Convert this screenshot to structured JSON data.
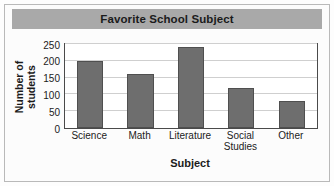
{
  "chart_data": {
    "type": "bar",
    "title": "Favorite School Subject",
    "xlabel": "Subject",
    "ylabel_line1": "Number of",
    "ylabel_line2": "students",
    "categories": [
      "Science",
      "Math",
      "Literature",
      "Social Studies",
      "Other"
    ],
    "category_lines": [
      [
        "Science"
      ],
      [
        "Math"
      ],
      [
        "Literature"
      ],
      [
        "Social",
        "Studies"
      ],
      [
        "Other"
      ]
    ],
    "values": [
      200,
      160,
      240,
      120,
      80
    ],
    "ylim": [
      0,
      250
    ],
    "yticks": [
      0,
      50,
      100,
      150,
      200,
      250
    ],
    "ytick_labels": [
      "0",
      "50",
      "100",
      "150",
      "200",
      "250"
    ],
    "grid": true,
    "legend": "none",
    "colors": {
      "bar_fill": "#6e6e6e",
      "bar_edge": "#4f4f4f",
      "title_band": "#a9a9a9",
      "plot_border": "#4a4a4a",
      "gridline": "#cfcfcf",
      "text": "#1b1b1b",
      "plot_background": "#ffffff",
      "figure_background": "#fcfcfc",
      "frame_border": "#b9b9b9"
    }
  }
}
